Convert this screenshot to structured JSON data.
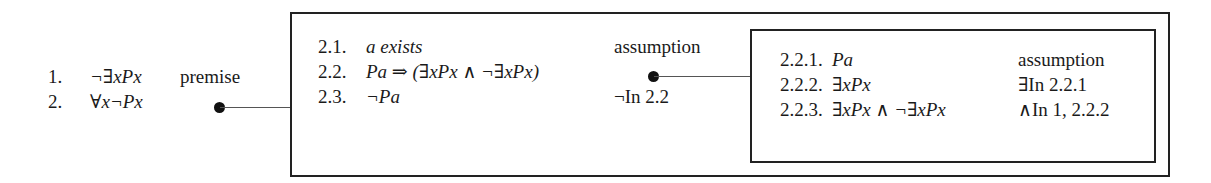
{
  "proof": {
    "main": [
      {
        "num": "1.",
        "formula": "¬∃xPx",
        "justification": "premise"
      },
      {
        "num": "2.",
        "formula": "∀x¬Px",
        "justification": ""
      }
    ],
    "subproof_2": [
      {
        "num": "2.1.",
        "formula": "a exists",
        "justification": "assumption"
      },
      {
        "num": "2.2.",
        "formula": "Pa ⇒ (∃xPx ∧ ¬∃xPx)",
        "justification": ""
      },
      {
        "num": "2.3.",
        "formula": "¬Pa",
        "justification": "¬In  2.2"
      }
    ],
    "subproof_2_2": [
      {
        "num": "2.2.1.",
        "formula": "Pa",
        "justification": "assumption"
      },
      {
        "num": "2.2.2.",
        "formula": "∃xPx",
        "justification": "∃In  2.2.1"
      },
      {
        "num": "2.2.3.",
        "formula": "∃xPx ∧ ¬∃xPx",
        "justification": "∧In  1, 2.2.2"
      }
    ]
  }
}
